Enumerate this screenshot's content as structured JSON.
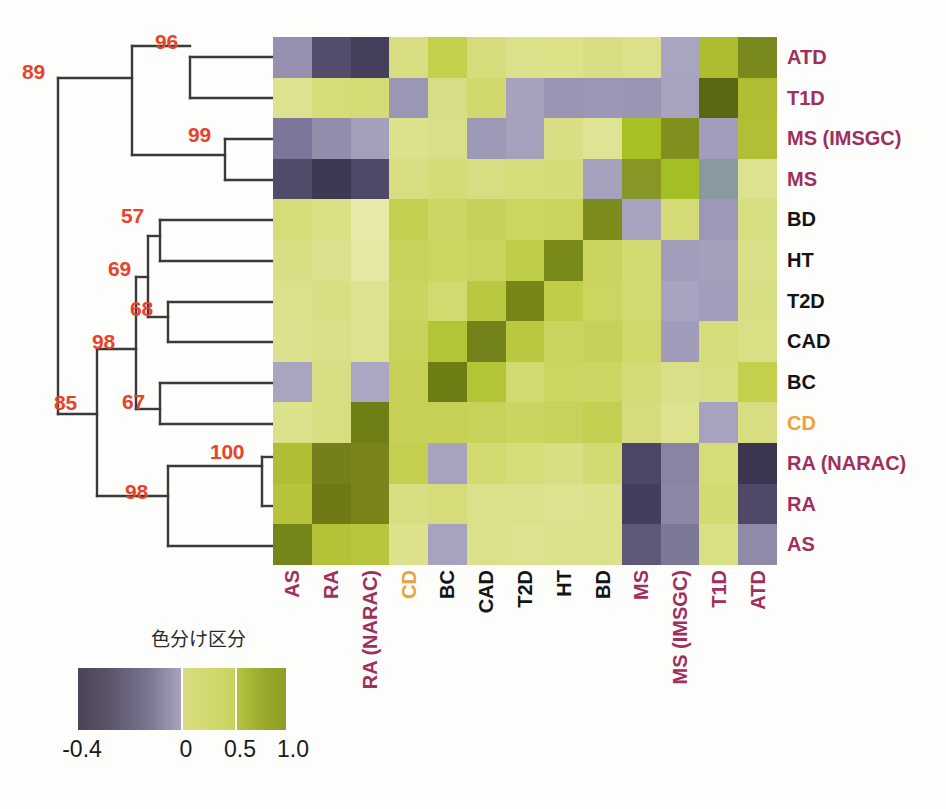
{
  "figure": {
    "type": "heatmap-with-dendrogram",
    "legend_title": "色分け区分"
  },
  "labels": {
    "rows": [
      "ATD",
      "T1D",
      "MS (IMSGC)",
      "MS",
      "BD",
      "HT",
      "T2D",
      "CAD",
      "BC",
      "CD",
      "RA (NARAC)",
      "RA",
      "AS"
    ],
    "columns": [
      "AS",
      "RA",
      "RA (NARAC)",
      "CD",
      "BC",
      "CAD",
      "T2D",
      "HT",
      "BD",
      "MS",
      "MS (IMSGC)",
      "T1D",
      "ATD"
    ],
    "row_colors": [
      "#a02f5e",
      "#a02f5e",
      "#a02f5e",
      "#a02f5e",
      "#141414",
      "#141414",
      "#141414",
      "#141414",
      "#141414",
      "#e8a33d",
      "#a02f5e",
      "#a02f5e",
      "#a02f5e"
    ],
    "column_colors": [
      "#a02f5e",
      "#a02f5e",
      "#a02f5e",
      "#e8a33d",
      "#141414",
      "#141414",
      "#141414",
      "#141414",
      "#141414",
      "#a02f5e",
      "#a02f5e",
      "#a02f5e",
      "#a02f5e"
    ]
  },
  "colorbar": {
    "ticks": [
      "-0.4",
      "0",
      "0.5",
      "1.0"
    ],
    "tick_positions": [
      0,
      49.5,
      75.5,
      100
    ],
    "dividers": [
      49.8,
      75.5
    ],
    "low_color": "#4b4459",
    "mid_color": "#d9dc81",
    "high_color": "#8e9e27"
  },
  "dendrogram": {
    "bootstrap_color": "#e8432a",
    "nodes": [
      {
        "id": "n89",
        "label": "89",
        "x": 40,
        "y": 77
      },
      {
        "id": "n96",
        "label": "96",
        "x": 155,
        "y": 54
      },
      {
        "id": "n99",
        "label": "99",
        "x": 217,
        "y": 139
      },
      {
        "id": "n57",
        "label": "57",
        "x": 150,
        "y": 215
      },
      {
        "id": "n69",
        "label": "69",
        "x": 126,
        "y": 266
      },
      {
        "id": "n68",
        "label": "68",
        "x": 160,
        "y": 305
      },
      {
        "id": "n98a",
        "label": "98",
        "x": 108,
        "y": 337
      },
      {
        "id": "n67",
        "label": "67",
        "x": 136,
        "y": 407
      },
      {
        "id": "n85",
        "label": "85",
        "x": 79,
        "y": 407
      },
      {
        "id": "n100",
        "label": "100",
        "x": 207,
        "y": 447
      },
      {
        "id": "n98b",
        "label": "98",
        "x": 124,
        "y": 489
      }
    ]
  },
  "chart_data": {
    "type": "heatmap",
    "title": "",
    "xlabel": "",
    "ylabel": "",
    "legend_title": "色分け区分",
    "colorbar_range": [
      -0.4,
      1.0
    ],
    "colorbar_ticks": [
      -0.4,
      0,
      0.5,
      1.0
    ],
    "grid": false,
    "legend_position": "bottom-left",
    "x": [
      "AS",
      "RA",
      "RA (NARAC)",
      "CD",
      "BC",
      "CAD",
      "T2D",
      "HT",
      "BD",
      "MS",
      "MS (IMSGC)",
      "T1D",
      "ATD"
    ],
    "y": [
      "ATD",
      "T1D",
      "MS (IMSGC)",
      "MS",
      "BD",
      "HT",
      "T2D",
      "CAD",
      "BC",
      "CD",
      "RA (NARAC)",
      "RA",
      "AS"
    ],
    "values": [
      [
        -0.15,
        -0.3,
        -0.38,
        0.3,
        0.45,
        0.35,
        0.3,
        0.32,
        0.3,
        0.3,
        -0.12,
        0.55,
        1.0
      ],
      [
        0.35,
        0.4,
        0.38,
        -0.12,
        0.28,
        0.3,
        -0.15,
        -0.18,
        -0.2,
        -0.16,
        -0.14,
        1.0,
        0.55
      ],
      [
        -0.22,
        -0.12,
        -0.1,
        0.3,
        0.32,
        -0.14,
        -0.15,
        0.3,
        0.28,
        0.6,
        1.0,
        -0.14,
        -0.12
      ],
      [
        -0.28,
        -0.35,
        -0.3,
        0.32,
        0.33,
        0.32,
        0.32,
        0.3,
        -0.13,
        1.0,
        0.6,
        -0.16,
        0.3
      ],
      [
        0.35,
        0.3,
        0.42,
        0.55,
        0.5,
        0.52,
        0.5,
        0.48,
        1.0,
        -0.13,
        0.3,
        -0.2,
        0.3
      ],
      [
        0.35,
        0.33,
        0.44,
        0.52,
        0.48,
        0.5,
        0.52,
        1.0,
        0.48,
        0.3,
        0.28,
        -0.18,
        0.32
      ],
      [
        0.33,
        0.35,
        0.4,
        0.5,
        0.46,
        0.58,
        1.0,
        0.52,
        0.5,
        0.32,
        -0.15,
        -0.15,
        0.3
      ],
      [
        0.32,
        0.35,
        0.4,
        0.52,
        0.6,
        1.0,
        0.58,
        0.5,
        0.52,
        0.32,
        -0.14,
        0.3,
        0.35
      ],
      [
        -0.12,
        0.38,
        -0.12,
        0.54,
        1.0,
        0.6,
        0.46,
        0.48,
        0.5,
        0.33,
        0.32,
        0.28,
        0.45
      ],
      [
        0.3,
        0.36,
        0.62,
        1.0,
        0.54,
        0.52,
        0.5,
        0.52,
        0.55,
        0.32,
        0.3,
        -0.12,
        0.3
      ],
      [
        0.55,
        0.72,
        1.0,
        0.62,
        -0.12,
        0.4,
        0.4,
        0.44,
        0.42,
        -0.3,
        -0.1,
        0.38,
        -0.38
      ],
      [
        0.52,
        1.0,
        0.72,
        0.36,
        0.38,
        0.35,
        0.35,
        0.33,
        0.3,
        -0.35,
        -0.12,
        0.4,
        -0.3
      ],
      [
        1.0,
        0.52,
        0.55,
        0.3,
        -0.12,
        0.32,
        0.33,
        0.35,
        0.35,
        -0.28,
        -0.22,
        0.35,
        -0.15
      ]
    ],
    "cell_colors": [
      [
        "#9790b0",
        "#534c6b",
        "#453f5b",
        "#d8dd82",
        "#c3cf4d",
        "#d6dc7c",
        "#dbe08a",
        "#dde289",
        "#d9de84",
        "#dbe089",
        "#a9a4c0",
        "#aebc2f",
        "#79891e"
      ],
      [
        "#dde28e",
        "#d5dc78",
        "#d4da74",
        "#9c96b5",
        "#d7dd85",
        "#d1d96c",
        "#a6a1bd",
        "#9b95b3",
        "#9d97b5",
        "#9b94b2",
        "#a7a2be",
        "#5a6813",
        "#b0bd33"
      ],
      [
        "#7d769a",
        "#938cab",
        "#a49fbb",
        "#dce18c",
        "#d9df86",
        "#9d98b6",
        "#a5a0bc",
        "#d9de85",
        "#dfe495",
        "#a9c025",
        "#808f1d",
        "#a29dba",
        "#b2bf36"
      ],
      [
        "#514a69",
        "#3e3854",
        "#4f4868",
        "#d8dd81",
        "#d4db77",
        "#d7dd80",
        "#d5dc7a",
        "#d5db78",
        "#a6a1bd",
        "#879624",
        "#a4bf26",
        "#8a99a0",
        "#dde290"
      ],
      [
        "#d5dc79",
        "#d9df85",
        "#e6e9a8",
        "#c3cf50",
        "#cdd663",
        "#c6d159",
        "#ccd560",
        "#cad45c",
        "#7e8c1b",
        "#a7a2be",
        "#d4db76",
        "#9d98b6",
        "#d7dd81"
      ],
      [
        "#d8de83",
        "#dce18d",
        "#e5e8a5",
        "#c7d25a",
        "#ccd55f",
        "#c9d35d",
        "#c0cd48",
        "#7a8a18",
        "#c9d35d",
        "#d3da72",
        "#a19cb9",
        "#a49fbb",
        "#d9df86"
      ],
      [
        "#dbe08b",
        "#d9de85",
        "#dde290",
        "#cbd45f",
        "#d1d96f",
        "#b9c840",
        "#778617",
        "#c0cd48",
        "#ccd560",
        "#d1d96f",
        "#a8a3bf",
        "#a29dba",
        "#d8de83"
      ],
      [
        "#dce18d",
        "#dadf87",
        "#dde28e",
        "#c8d25b",
        "#b4c437",
        "#73821a",
        "#b9c840",
        "#c9d35d",
        "#c6d159",
        "#d0d86a",
        "#a09bb8",
        "#d6dc7c",
        "#d9df85"
      ],
      [
        "#a9a4c0",
        "#d8de83",
        "#aba6c2",
        "#c5d055",
        "#6e7e15",
        "#b4c437",
        "#d1d96f",
        "#ccd55f",
        "#cdd663",
        "#d4db76",
        "#d9df86",
        "#d8dd82",
        "#c3cf4d"
      ],
      [
        "#dce18c",
        "#d7dd80",
        "#6f7f16",
        "#c5d055",
        "#c5d055",
        "#c8d25b",
        "#cbd45f",
        "#c7d25a",
        "#c3cf50",
        "#d6dc7d",
        "#dde28f",
        "#a7a2be",
        "#d8dd82"
      ],
      [
        "#b1be34",
        "#757f1b",
        "#7a8418",
        "#c3cf50",
        "#a7a2be",
        "#d2da71",
        "#d5dc7a",
        "#d8de83",
        "#d3da72",
        "#4d4667",
        "#8a84a3",
        "#d5dc79",
        "#3b3550"
      ],
      [
        "#b6c33b",
        "#6f7a17",
        "#79831a",
        "#d7dd80",
        "#d5dc7a",
        "#dbe08b",
        "#dbe08b",
        "#dde28e",
        "#dce18c",
        "#443d5e",
        "#8d87a6",
        "#d3da72",
        "#4f4869"
      ],
      [
        "#76851b",
        "#b5c238",
        "#bac53f",
        "#dce18c",
        "#a7a2be",
        "#dbe08b",
        "#dde28f",
        "#dce18c",
        "#dbe08b",
        "#5f5878",
        "#7e7898",
        "#d9df85",
        "#908aa9"
      ]
    ]
  }
}
